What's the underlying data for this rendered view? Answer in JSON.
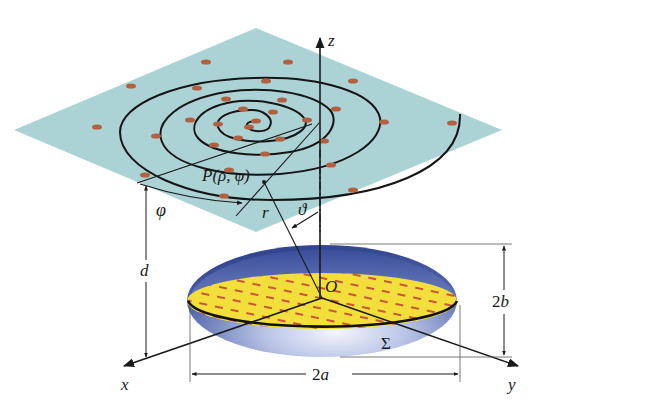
{
  "figure": {
    "colors": {
      "plane": "#a9d2d4",
      "spiral": "#151515",
      "spiral_markers": "#b0603e",
      "ellipsoid_dark": "#3d4f9a",
      "ellipsoid_light": "#e8ecf8",
      "section_fill": "#f2df3c",
      "section_dashes": "#c5523a",
      "axes": "#1a1a1a"
    }
  },
  "labels": {
    "z_axis": "z",
    "x_axis": "x",
    "y_axis": "y",
    "origin": "O",
    "point": "P(ρ, φ)",
    "angle_phi": "φ",
    "radius_r": "r",
    "angle_theta": "ϑ",
    "height_d": "d",
    "width_2a": "2a",
    "height_2b": "2b",
    "surface_sigma": "Σ"
  }
}
